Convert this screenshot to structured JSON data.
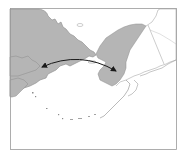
{
  "map": {
    "region": "Bering Strait",
    "frame": {
      "x": 10,
      "y": 8,
      "width": 167,
      "height": 142,
      "stroke": "#9a9a9a"
    },
    "colors": {
      "background": "#ffffff",
      "highlighted_land": "#b5b5b5",
      "outline_land": "#ffffff",
      "coastline": "#8c8c8c",
      "border_line": "#9a9a9a",
      "arrow": "#1a1a1a"
    },
    "landmasses": [
      {
        "name": "Siberia / Chukotka",
        "fill": "highlighted"
      },
      {
        "name": "Alaska",
        "fill": "highlighted-west",
        "note": "western portion shaded"
      },
      {
        "name": "Canada (Yukon)",
        "fill": "outline"
      }
    ],
    "arrow": {
      "type": "double-headed curved",
      "from": [
        40,
        67
      ],
      "to": [
        117,
        71
      ],
      "meaning": "migration across the Bering land bridge"
    }
  }
}
